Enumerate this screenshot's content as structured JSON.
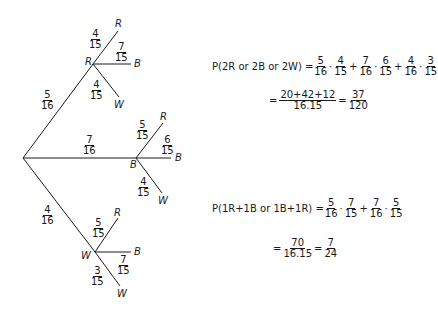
{
  "tree": {
    "level1": [
      {
        "label": "R",
        "prob": {
          "num": "5",
          "den": "16"
        }
      },
      {
        "label": "B",
        "prob": {
          "num": "7",
          "den": "16"
        }
      },
      {
        "label": "W",
        "prob": {
          "num": "4",
          "den": "16"
        }
      }
    ],
    "branch_R": [
      {
        "label": "R",
        "prob": {
          "num": "4",
          "den": "15"
        }
      },
      {
        "label": "B",
        "prob": {
          "num": "7",
          "den": "15"
        }
      },
      {
        "label": "W",
        "prob": {
          "num": "4",
          "den": "15"
        }
      }
    ],
    "branch_B": [
      {
        "label": "R",
        "prob": {
          "num": "5",
          "den": "15"
        }
      },
      {
        "label": "B",
        "prob": {
          "num": "6",
          "den": "15"
        }
      },
      {
        "label": "W",
        "prob": {
          "num": "4",
          "den": "15"
        }
      }
    ],
    "branch_W": [
      {
        "label": "R",
        "prob": {
          "num": "5",
          "den": "15"
        }
      },
      {
        "label": "B",
        "prob": {
          "num": "7",
          "den": "15"
        }
      },
      {
        "label": "W",
        "prob": {
          "num": "3",
          "den": "15"
        }
      }
    ]
  },
  "equation1": {
    "lhs": "P(2R or 2B or 2W) =",
    "terms": [
      {
        "a": {
          "num": "5",
          "den": "16"
        },
        "b": {
          "num": "4",
          "den": "15"
        }
      },
      {
        "a": {
          "num": "7",
          "den": "16"
        },
        "b": {
          "num": "6",
          "den": "15"
        }
      },
      {
        "a": {
          "num": "4",
          "den": "16"
        },
        "b": {
          "num": "3",
          "den": "15"
        }
      }
    ],
    "step2_num": "20+42+12",
    "step2_den": "16.15",
    "result": {
      "num": "37",
      "den": "120"
    }
  },
  "equation2": {
    "lhs": "P(1R+1B or 1B+1R) =",
    "terms": [
      {
        "a": {
          "num": "5",
          "den": "16"
        },
        "b": {
          "num": "7",
          "den": "15"
        }
      },
      {
        "a": {
          "num": "7",
          "den": "16"
        },
        "b": {
          "num": "5",
          "den": "15"
        }
      }
    ],
    "step2_num": "70",
    "step2_den": "16.15",
    "result": {
      "num": "7",
      "den": "24"
    }
  },
  "symbols": {
    "eq": "=",
    "plus": "+",
    "dot": "·"
  }
}
